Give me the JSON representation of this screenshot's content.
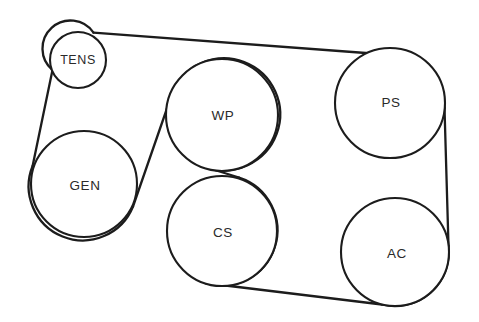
{
  "diagram": {
    "type": "belt-routing-schematic",
    "background_color": "#ffffff",
    "line_color": "#1c1c1c",
    "label_color": "#2a2a2a",
    "canvas": {
      "width": 479,
      "height": 322
    },
    "pulleys": [
      {
        "id": "tens",
        "label": "TENS",
        "name": "belt-tensioner",
        "cx": 78,
        "cy": 60,
        "r": 28,
        "label_x": 78,
        "label_y": 61
      },
      {
        "id": "gen",
        "label": "GEN",
        "name": "generator-alternator",
        "cx": 84,
        "cy": 184,
        "r": 53,
        "label_x": 85,
        "label_y": 186
      },
      {
        "id": "wp",
        "label": "WP",
        "name": "water-pump",
        "cx": 222,
        "cy": 115,
        "r": 56,
        "label_x": 223,
        "label_y": 116
      },
      {
        "id": "cs",
        "label": "CS",
        "name": "crankshaft",
        "cx": 222,
        "cy": 231,
        "r": 55,
        "label_x": 223,
        "label_y": 233
      },
      {
        "id": "ps",
        "label": "PS",
        "name": "power-steering-pump",
        "cx": 390,
        "cy": 103,
        "r": 55,
        "label_x": 391,
        "label_y": 103
      },
      {
        "id": "ac",
        "label": "AC",
        "name": "air-conditioning-compressor",
        "cx": 395,
        "cy": 252,
        "r": 54,
        "label_x": 397,
        "label_y": 254
      }
    ],
    "belt_segments": [
      {
        "id": "top-run",
        "name": "belt-segment-tens-to-ps",
        "from": "tens",
        "to": "ps",
        "d": "M 93.5 32.6 L 372.5 53.5"
      },
      {
        "id": "left-run",
        "name": "belt-segment-tens-to-gen",
        "from": "tens",
        "to": "gen",
        "d": "M 52.5 70.0 L 32.6 166.0"
      },
      {
        "id": "gen-to-wp-run",
        "name": "belt-segment-gen-to-wp",
        "from": "gen",
        "to": "wp",
        "d": "M 133.0 206.5 L 172.0 94.0"
      },
      {
        "id": "bottom-run",
        "name": "belt-segment-cs-to-ac",
        "from": "cs",
        "to": "ac",
        "d": "M 205.0 283.0 L 382.0 304.5"
      },
      {
        "id": "right-run",
        "name": "belt-segment-ps-to-ac",
        "from": "ps",
        "to": "ac",
        "d": "M 444.5 108.0 L 448.5 246.0"
      }
    ],
    "belt_arcs": [
      {
        "id": "tens-wrap",
        "name": "belt-wrap-tens",
        "pulley": "tens",
        "d": "M 93.5 32.6 A 28 28 0 1 0 52.5 70.0"
      },
      {
        "id": "gen-wrap",
        "name": "belt-wrap-gen",
        "pulley": "gen",
        "d": "M 32.6 166.0 A 53 53 0 1 0 133.0 206.5"
      },
      {
        "id": "wp-wrap",
        "name": "belt-wrap-wp",
        "pulley": "wp",
        "d": "M 172.0 94.0 A 56 56 0 1 1 205.0 167.0"
      },
      {
        "id": "cs-wrap",
        "name": "belt-wrap-cs",
        "pulley": "cs",
        "d": "M 239.0 177.5 A 55 55 0 1 1 205.0 283.0"
      },
      {
        "id": "ps-wrap",
        "name": "belt-wrap-ps",
        "pulley": "ps",
        "d": "M 372.5 53.5 A 55 55 0 0 1 444.5 108.0"
      },
      {
        "id": "ac-wrap",
        "name": "belt-wrap-ac",
        "pulley": "ac",
        "d": "M 448.5 246.0 A 54 54 0 0 1 382.0 304.5"
      }
    ],
    "belt_cross": {
      "id": "wp-cs-cross",
      "name": "belt-cross-wp-cs",
      "d": "M 205.0 167.0 L 239.0 177.5"
    }
  }
}
